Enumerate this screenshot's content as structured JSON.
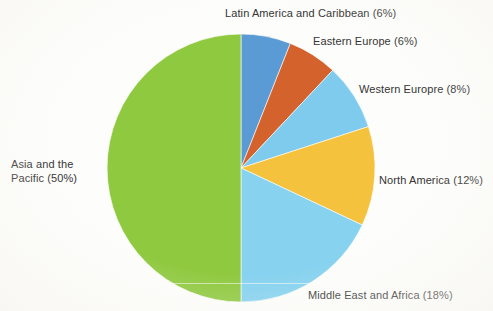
{
  "chart_data": {
    "type": "pie",
    "title": "",
    "subtitle": "",
    "xlabel": "",
    "ylabel": "",
    "legend_position": "none",
    "grid": false,
    "start_angle_deg": 0,
    "direction": "clockwise",
    "total_percent": 100,
    "categories": [
      "Asia and the Pacific",
      "Latin America and Caribbean",
      "Eastern Europe",
      "Western Europre",
      "North America",
      "Middle East and Africa"
    ],
    "values": [
      50,
      6,
      6,
      8,
      12,
      18
    ],
    "colors": [
      "#8fc93f",
      "#5b9bd5",
      "#d4622c",
      "#7ecbee",
      "#f5c23e",
      "#86d2ef"
    ],
    "slices": [
      {
        "name": "latin-america-and-caribbean",
        "label": "Latin America and Caribbean (6%)",
        "category": "Latin America and Caribbean",
        "value": 6,
        "color": "#5b9bd5",
        "start_deg": 0,
        "end_deg": 21.6
      },
      {
        "name": "eastern-europe",
        "label": "Eastern Europe (6%)",
        "category": "Eastern Europe",
        "value": 6,
        "color": "#d4622c",
        "start_deg": 21.6,
        "end_deg": 43.2
      },
      {
        "name": "western-europe",
        "label": "Western Europre (8%)",
        "category": "Western Europre",
        "value": 8,
        "color": "#7ecbee",
        "start_deg": 43.2,
        "end_deg": 72
      },
      {
        "name": "north-america",
        "label": "North America (12%)",
        "category": "North America",
        "value": 12,
        "color": "#f5c23e",
        "start_deg": 72,
        "end_deg": 115.2
      },
      {
        "name": "middle-east-and-africa",
        "label": "Middle East and Africa (18%)",
        "category": "Middle East and Africa",
        "value": 18,
        "color": "#86d2ef",
        "start_deg": 115.2,
        "end_deg": 180
      },
      {
        "name": "asia-and-the-pacific",
        "label": "Asia and the\nPacific (50%)",
        "category": "Asia and the Pacific",
        "value": 50,
        "color": "#8fc93f",
        "start_deg": 180,
        "end_deg": 360
      }
    ]
  },
  "labels": {
    "latin_america": "Latin America and Caribbean (6%)",
    "eastern_europe": "Eastern Europe (6%)",
    "western_europe": "Western Europre (8%)",
    "north_america": "North America (12%)",
    "middle_east": "Middle East and Africa (18%)",
    "asia_pacific_line1": "Asia and the",
    "asia_pacific_line2": "Pacific (50%)"
  },
  "geometry": {
    "center_x": 241,
    "center_y": 168,
    "radius": 134
  }
}
